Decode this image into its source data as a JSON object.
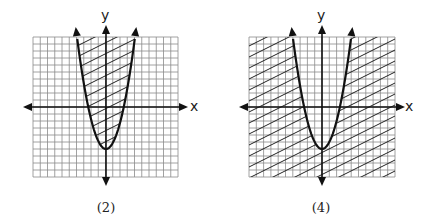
{
  "figures": [
    {
      "id": "2",
      "caption": "(2)",
      "x_label": "x",
      "y_label": "y",
      "shading": "inside",
      "origin": [
        106,
        107
      ],
      "grid": {
        "left": 33,
        "top": 37,
        "right": 178,
        "bottom": 177
      }
    },
    {
      "id": "4",
      "caption": "(4)",
      "x_label": "x",
      "y_label": "y",
      "shading": "outside",
      "origin": [
        322,
        107
      ],
      "grid": {
        "left": 249,
        "top": 37,
        "right": 395,
        "bottom": 177
      }
    }
  ],
  "graph": {
    "curve": "parabola",
    "equation_shape": "y = x^2 - 6",
    "vertex": [
      0,
      -6
    ],
    "grid_units": 20,
    "colors": {
      "grid": "#8a8a8a",
      "axis": "#111111",
      "curve": "#111111",
      "hatch": "#222222"
    }
  }
}
